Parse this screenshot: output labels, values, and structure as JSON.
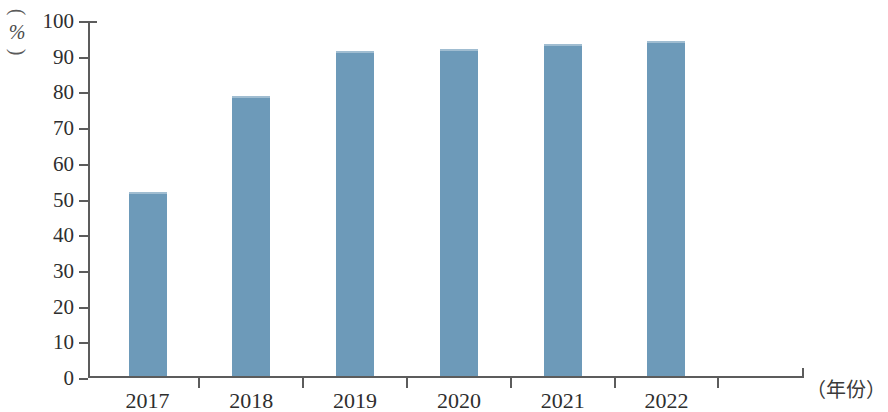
{
  "chart_data": {
    "type": "bar",
    "title": "",
    "subtitle": "",
    "categories": [
      "2017",
      "2018",
      "2019",
      "2020",
      "2021",
      "2022"
    ],
    "values": [
      51.5,
      78.5,
      91,
      91.5,
      93,
      93.8
    ],
    "series": [
      {
        "name": "",
        "values": [
          51.5,
          78.5,
          91,
          91.5,
          93,
          93.8
        ]
      }
    ],
    "xlabel": "（年份）",
    "ylabel": "（%）",
    "ylabel_unit": "%",
    "ylim": [
      0,
      100
    ],
    "ytick_labels": [
      "100",
      "90",
      "80",
      "70",
      "60",
      "50",
      "40",
      "30",
      "20",
      "10",
      "0"
    ],
    "ytick_values": [
      100,
      90,
      80,
      70,
      60,
      50,
      40,
      30,
      20,
      10,
      0
    ],
    "ytick_step": 10,
    "grid": false,
    "legend": false,
    "legend_position": "none",
    "bar_color": "#6d9ab9",
    "axis_color": "#5c5c5c",
    "text_color": "#2e2e2e"
  }
}
